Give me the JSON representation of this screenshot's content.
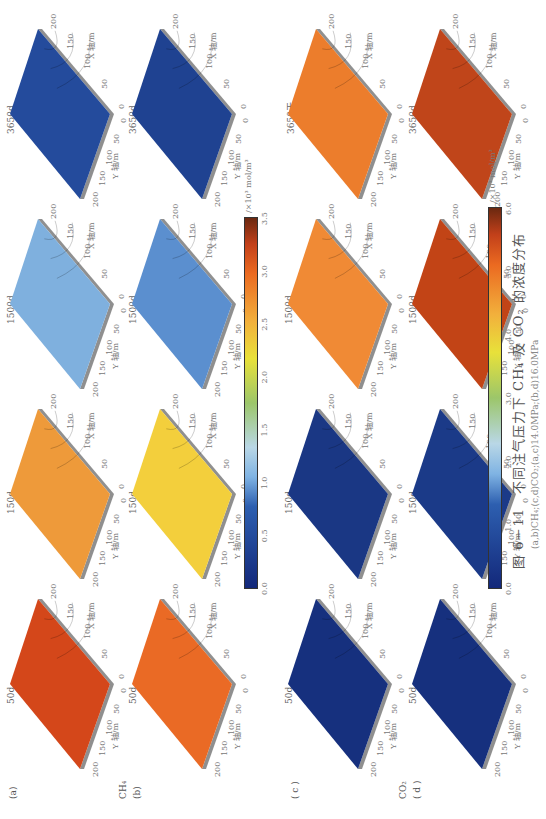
{
  "figure": {
    "caption": "图 6－11　不同注气压力下 CH₄ 及 CO₂ 的浓度分布",
    "subcaption": "(a,b)CH₄;(c,d)CO₂;(a,c)14.0MPa;(b,d)16.0MPa"
  },
  "row_labels": {
    "a": "(a)",
    "b": "(b)",
    "b_species": "CH₄",
    "c": "( c )",
    "d": "( d )",
    "d_species": "CO₂"
  },
  "axes": {
    "x_label": "X 轴/m",
    "y_label": "Y 轴/m",
    "x_ticks": [
      "0",
      "50",
      "100",
      "150",
      "200"
    ],
    "y_ticks": [
      "200",
      "150",
      "100",
      "50",
      "0"
    ]
  },
  "colorbars": [
    {
      "name": "CH4",
      "unit": "/×10³ mol/m³",
      "ticks": [
        "0.0",
        "0.5",
        "1.0",
        "1.5",
        "2.0",
        "2.5",
        "3.0",
        "3.5"
      ]
    },
    {
      "name": "CO2",
      "unit": "/×10³ mol/m³",
      "ticks": [
        "0.0",
        "1.0",
        "2.0",
        "3.0",
        "4.0",
        "5.0",
        "6.0"
      ]
    }
  ],
  "chart_data": {
    "type": "heatmap",
    "title": "不同注气压力下 CH₄ 及 CO₂ 的浓度分布",
    "xlabel": "X 轴/m",
    "ylabel": "Y 轴/m",
    "xlim": [
      0,
      200
    ],
    "ylim": [
      0,
      200
    ],
    "times": [
      "50d",
      "150d",
      "1500d",
      "3650d"
    ],
    "rows": [
      {
        "id": "a",
        "species": "CH4",
        "pressure": "14.0MPa",
        "colorbar_range": [
          0,
          3.5
        ],
        "panels": [
          {
            "time": "50d",
            "title": "50d",
            "approx_mean": 3.2,
            "color": "#d4471a"
          },
          {
            "time": "150d",
            "title": "150d",
            "approx_mean": 2.8,
            "color": "#ee9a3a"
          },
          {
            "time": "1500d",
            "title": "1500d",
            "approx_mean": 1.1,
            "color": "#7fb0de"
          },
          {
            "time": "3650d",
            "title": "3650d",
            "approx_mean": 0.3,
            "color": "#244b9c"
          }
        ]
      },
      {
        "id": "b",
        "species": "CH4",
        "pressure": "16.0MPa",
        "colorbar_range": [
          0,
          3.5
        ],
        "panels": [
          {
            "time": "50d",
            "title": "50d",
            "approx_mean": 3.0,
            "color": "#ea6a25"
          },
          {
            "time": "150d",
            "title": "150d",
            "approx_mean": 2.5,
            "color": "#f3cf3c"
          },
          {
            "time": "1500d",
            "title": "1500d",
            "approx_mean": 0.9,
            "color": "#5b8fcf"
          },
          {
            "time": "3650d",
            "title": "3650d",
            "approx_mean": 0.2,
            "color": "#1f4291"
          }
        ]
      },
      {
        "id": "c",
        "species": "CO2",
        "pressure": "14.0MPa",
        "colorbar_range": [
          0,
          6.0
        ],
        "panels": [
          {
            "time": "50d",
            "title": "50d",
            "approx_mean": 0.2,
            "color": "#16307e"
          },
          {
            "time": "150d",
            "title": "150d",
            "approx_mean": 0.5,
            "color": "#1a3784"
          },
          {
            "time": "1500d",
            "title": "1500d",
            "approx_mean": 4.8,
            "color": "#f08a35"
          },
          {
            "time": "3650d",
            "title": "3650天",
            "approx_mean": 5.0,
            "color": "#ec7d2c"
          }
        ]
      },
      {
        "id": "d",
        "species": "CO2",
        "pressure": "16.0MPa",
        "colorbar_range": [
          0,
          6.0
        ],
        "panels": [
          {
            "time": "50d",
            "title": "50d",
            "approx_mean": 0.3,
            "color": "#16307e"
          },
          {
            "time": "150d",
            "title": "150d",
            "approx_mean": 0.6,
            "color": "#1b3a88"
          },
          {
            "time": "1500d",
            "title": "1500d",
            "approx_mean": 5.6,
            "color": "#c24416"
          },
          {
            "time": "3650d",
            "title": "3650d",
            "approx_mean": 5.7,
            "color": "#c0451a"
          }
        ]
      }
    ]
  }
}
